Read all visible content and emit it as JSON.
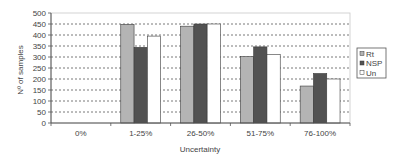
{
  "chart_data": {
    "type": "bar",
    "title": "",
    "xlabel": "Uncertainty",
    "ylabel": "Nº of samples",
    "categories": [
      "0%",
      "1-25%",
      "26-50%",
      "51-75%",
      "76-100%"
    ],
    "series": [
      {
        "name": "Rt",
        "color": "#b4b4b4",
        "values": [
          0,
          448,
          440,
          302,
          168
        ]
      },
      {
        "name": "NSP",
        "color": "#525252",
        "values": [
          0,
          344,
          450,
          346,
          225
        ]
      },
      {
        "name": "Un",
        "color": "#ffffff",
        "values": [
          0,
          395,
          450,
          312,
          200
        ]
      }
    ],
    "ylim": [
      0,
      500
    ],
    "yticks": [
      0,
      50,
      100,
      150,
      200,
      250,
      300,
      350,
      400,
      450,
      500
    ],
    "grid": true,
    "grid_style": "dashed",
    "legend_position": "right"
  }
}
